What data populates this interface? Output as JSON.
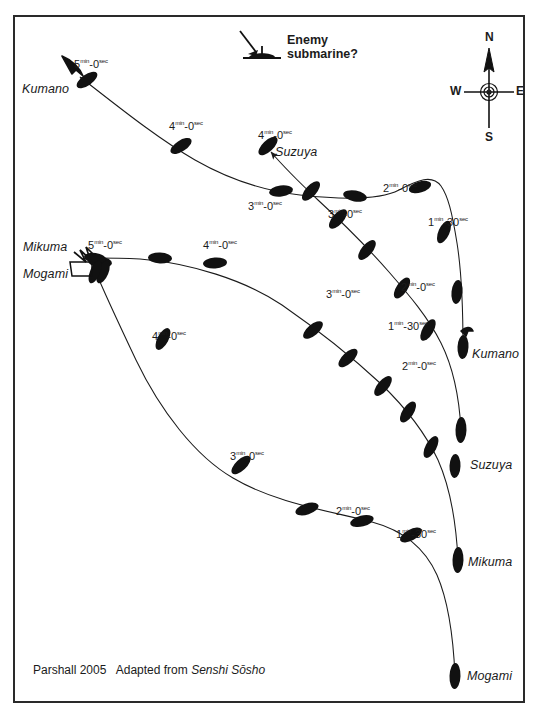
{
  "figure": {
    "credit_author": "Parshall 2005",
    "credit_source_prefix": "Adapted from",
    "credit_source": "Senshi Sōsho",
    "frame_color": "#2a2a2a",
    "ink_color": "#1b1b1b",
    "background": "#ffffff"
  },
  "annotations": {
    "enemy_line1": "Enemy",
    "enemy_line2": "submarine?",
    "enemy_icon": "submarine-periscope-icon"
  },
  "compass": {
    "north": "N",
    "south": "S",
    "east": "E",
    "west": "W",
    "icon": "compass-rose-icon"
  },
  "ships": [
    {
      "name": "Kumano",
      "role": "end-label"
    },
    {
      "name": "Suzuya",
      "role": "end-label"
    },
    {
      "name": "Mikuma",
      "role": "end-label"
    },
    {
      "name": "Mogami",
      "role": "end-label"
    },
    {
      "name": "Kumano",
      "role": "start-label"
    },
    {
      "name": "Suzuya",
      "role": "start-label"
    },
    {
      "name": "Mikuma",
      "role": "start-label"
    },
    {
      "name": "Mogami",
      "role": "start-label"
    }
  ],
  "labels": {
    "kumano_end": "Kumano",
    "kumano_start": "Kumano",
    "suzuya_end": "Suzuya",
    "suzuya_start": "Suzuya",
    "mikuma_end": "Mikuma",
    "mikuma_start": "Mikuma",
    "mogami_end": "Mogami",
    "mogami_start": "Mogami"
  },
  "time_marks": {
    "kumano": [
      {
        "id": "k5",
        "min": "5",
        "sec": "0",
        "text": "5-0"
      },
      {
        "id": "k4",
        "min": "4",
        "sec": "0",
        "text": "4-0"
      },
      {
        "id": "k3",
        "min": "3",
        "sec": "0",
        "text": "3-0"
      },
      {
        "id": "k2",
        "min": "2",
        "sec": "0",
        "text": "2-0"
      },
      {
        "id": "k130",
        "min": "1",
        "sec": "30",
        "text": "1-30"
      }
    ],
    "suzuya": [
      {
        "id": "s4",
        "min": "4",
        "sec": "0",
        "text": "4-0"
      },
      {
        "id": "s3",
        "min": "3",
        "sec": "0",
        "text": "3-0"
      },
      {
        "id": "s2",
        "min": "2",
        "sec": "0",
        "text": "2-0"
      },
      {
        "id": "s130",
        "min": "1",
        "sec": "30",
        "text": "1-30"
      }
    ],
    "mikuma": [
      {
        "id": "mk5",
        "min": "5",
        "sec": "0",
        "text": "5-0"
      },
      {
        "id": "mk4",
        "min": "4",
        "sec": "0",
        "text": "4-0"
      },
      {
        "id": "mk3",
        "min": "3",
        "sec": "0",
        "text": "3-0"
      },
      {
        "id": "mk2",
        "min": "2",
        "sec": "0",
        "text": "2-0"
      }
    ],
    "mogami": [
      {
        "id": "mg4",
        "min": "4",
        "sec": "0",
        "text": "4-0"
      },
      {
        "id": "mg3",
        "min": "3",
        "sec": "0",
        "text": "3-0"
      },
      {
        "id": "mg2",
        "min": "2",
        "sec": "0",
        "text": "2-0"
      },
      {
        "id": "mg130",
        "min": "1",
        "sec": "30",
        "text": "1-30"
      }
    ]
  },
  "unit_superscripts": {
    "min": "min",
    "sec": "sec"
  }
}
